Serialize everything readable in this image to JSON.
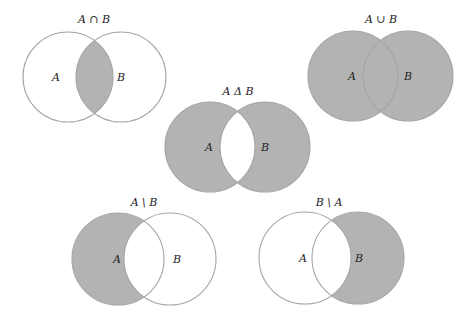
{
  "colors": {
    "background": "#ffffff",
    "fill": "#b3b3b3",
    "stroke": "#a6a6a6",
    "text": "#222222"
  },
  "diagrams": [
    {
      "id": "intersection",
      "title": "A ∩ B",
      "shaded": "intersection",
      "label_a": "A",
      "label_b": "B",
      "cy": 77,
      "r": 45,
      "ax": 68,
      "bx": 121,
      "title_x": 94,
      "title_y": 23
    },
    {
      "id": "union",
      "title": "A ∪ B",
      "shaded": "union",
      "label_a": "A",
      "label_b": "B",
      "cy": 76,
      "r": 45,
      "ax": 353,
      "bx": 408,
      "title_x": 381,
      "title_y": 23
    },
    {
      "id": "symmetric-difference",
      "title": "A Δ B",
      "shaded": "symmetric-difference",
      "label_a": "A",
      "label_b": "B",
      "cy": 147,
      "r": 45,
      "ax": 210,
      "bx": 265,
      "title_x": 238,
      "title_y": 95
    },
    {
      "id": "a-minus-b",
      "title": "A \\ B",
      "shaded": "a-only",
      "label_a": "A",
      "label_b": "B",
      "cy": 259,
      "r": 46,
      "ax": 118,
      "bx": 170,
      "title_x": 144,
      "title_y": 206
    },
    {
      "id": "b-minus-a",
      "title": "B \\ A",
      "shaded": "b-only",
      "label_a": "A",
      "label_b": "B",
      "cy": 258,
      "r": 46,
      "ax": 305,
      "bx": 358,
      "title_x": 329,
      "title_y": 206
    }
  ]
}
